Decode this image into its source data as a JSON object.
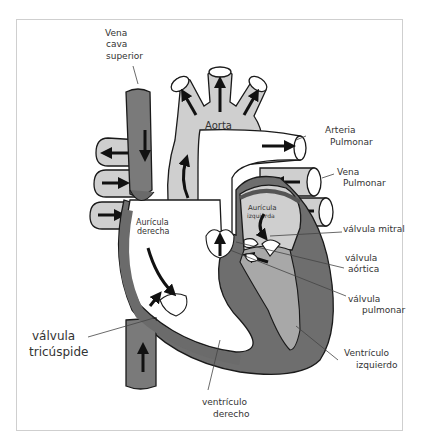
{
  "diagram": {
    "colors": {
      "deoxygenated": "#7a7a7a",
      "oxygenated": "#c8c8c8",
      "wall": "#6b6b6b",
      "outline": "#1a1a1a",
      "background": "#ffffff",
      "frame": "#cfcfcf"
    },
    "labels": {
      "vena_cava_superior": [
        "Vena",
        "cava",
        "superior"
      ],
      "aorta": "Aorta",
      "arteria_pulmonar": [
        "Arteria",
        "Pulmonar"
      ],
      "vena_pulmonar": [
        "Vena",
        "Pulmonar"
      ],
      "auricula_izquierda": [
        "Aurícula",
        "izquierda"
      ],
      "auricula_derecha": [
        "Aurícula",
        "derecha"
      ],
      "valvula_mitral": "válvula mitral",
      "valvula_aortica": [
        "válvula",
        "aórtica"
      ],
      "valvula_pulmonar": [
        "válvula",
        "pulmonar"
      ],
      "valvula_tricuspide": [
        "válvula",
        "tricúspide"
      ],
      "ventriculo_izquierdo": [
        "Ventrículo",
        "izquierdo"
      ],
      "ventriculo_derecho": [
        "ventrículo",
        "derecho"
      ]
    }
  }
}
